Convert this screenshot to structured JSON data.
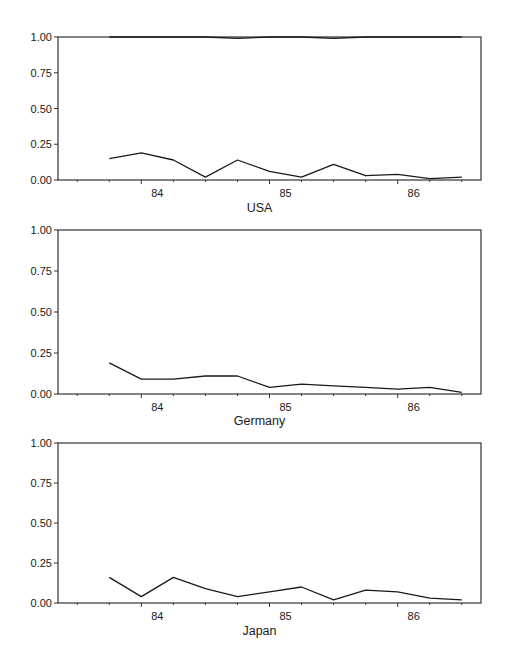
{
  "chart_data": [
    {
      "type": "line",
      "title": "USA",
      "xlabel": "USA",
      "ylabel": "",
      "ylim": [
        0,
        1
      ],
      "xlim": [
        83.35,
        86.65
      ],
      "yticks": [
        "0.00",
        "0.25",
        "0.50",
        "0.75",
        "1.00"
      ],
      "xticks": [
        "84",
        "85",
        "86"
      ],
      "grid": false,
      "x": [
        83.75,
        84.0,
        84.25,
        84.5,
        84.75,
        85.0,
        85.25,
        85.5,
        85.75,
        86.0,
        86.25,
        86.5
      ],
      "series": [
        {
          "name": "upper",
          "values": [
            1.0,
            1.0,
            1.0,
            1.0,
            0.99,
            1.0,
            1.0,
            0.99,
            1.0,
            1.0,
            1.0,
            1.0
          ]
        },
        {
          "name": "lower",
          "values": [
            0.15,
            0.19,
            0.14,
            0.02,
            0.14,
            0.06,
            0.02,
            0.11,
            0.03,
            0.04,
            0.01,
            0.02
          ]
        }
      ]
    },
    {
      "type": "line",
      "title": "Germany",
      "xlabel": "Germany",
      "ylabel": "",
      "ylim": [
        0,
        1
      ],
      "xlim": [
        83.35,
        86.65
      ],
      "yticks": [
        "0.00",
        "0.25",
        "0.50",
        "0.75",
        "1.00"
      ],
      "xticks": [
        "84",
        "85",
        "86"
      ],
      "grid": false,
      "x": [
        83.75,
        84.0,
        84.25,
        84.5,
        84.75,
        85.0,
        85.25,
        85.5,
        85.75,
        86.0,
        86.25,
        86.5
      ],
      "series": [
        {
          "name": "series",
          "values": [
            0.19,
            0.09,
            0.09,
            0.11,
            0.11,
            0.04,
            0.06,
            0.05,
            0.04,
            0.03,
            0.04,
            0.01
          ]
        }
      ]
    },
    {
      "type": "line",
      "title": "Japan",
      "xlabel": "Japan",
      "ylabel": "",
      "ylim": [
        0,
        1
      ],
      "xlim": [
        83.35,
        86.65
      ],
      "yticks": [
        "0.00",
        "0.25",
        "0.50",
        "0.75",
        "1.00"
      ],
      "xticks": [
        "84",
        "85",
        "86"
      ],
      "grid": false,
      "x": [
        83.75,
        84.0,
        84.25,
        84.5,
        84.75,
        85.0,
        85.25,
        85.5,
        85.75,
        86.0,
        86.25,
        86.5
      ],
      "series": [
        {
          "name": "series",
          "values": [
            0.16,
            0.04,
            0.16,
            0.09,
            0.04,
            0.07,
            0.1,
            0.02,
            0.08,
            0.07,
            0.03,
            0.02
          ]
        }
      ]
    }
  ],
  "panels": [
    {
      "label": "USA",
      "yticks": [
        "1.00",
        "0.75",
        "0.50",
        "0.25",
        "0.00"
      ],
      "xticks": [
        "84",
        "85",
        "86"
      ]
    },
    {
      "label": "Germany",
      "yticks": [
        "1.00",
        "0.75",
        "0.50",
        "0.25",
        "0.00"
      ],
      "xticks": [
        "84",
        "85",
        "86"
      ]
    },
    {
      "label": "Japan",
      "yticks": [
        "1.00",
        "0.75",
        "0.50",
        "0.25",
        "0.00"
      ],
      "xticks": [
        "84",
        "85",
        "86"
      ]
    }
  ],
  "colors": {
    "line": "#1a1a1a",
    "axis": "#333333",
    "background": "#ffffff"
  }
}
